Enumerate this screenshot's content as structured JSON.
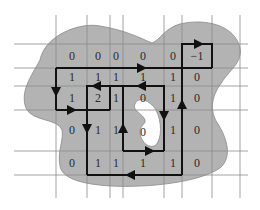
{
  "diagram": {
    "type": "winding-number-grid",
    "colors": {
      "region_fill": "#b3b3b3",
      "region_stroke": "#7a7a7a",
      "grid_line": "#8a8a8a",
      "path_stroke": "#111111",
      "hole_fill": "#ffffff",
      "text": "#2a2a2a"
    },
    "grid": {
      "vertical_lines_x": [
        56,
        87,
        110,
        123,
        164,
        182,
        212,
        240
      ],
      "horizontal_lines_y": [
        44,
        68,
        86,
        110,
        151,
        175
      ]
    },
    "rows": [
      {
        "y": 56,
        "cells": [
          {
            "x": 72,
            "value": "0"
          },
          {
            "x": 98,
            "value": "0"
          },
          {
            "x": 116,
            "value": "0"
          },
          {
            "x": 143,
            "value": "0"
          },
          {
            "x": 173,
            "value": "0"
          },
          {
            "x": 197,
            "value": "−1"
          }
        ]
      },
      {
        "y": 77,
        "cells": [
          {
            "x": 72,
            "value": "1"
          },
          {
            "x": 98,
            "value": "1"
          },
          {
            "x": 116,
            "value": "1"
          },
          {
            "x": 143,
            "value": "1"
          },
          {
            "x": 173,
            "value": "1"
          },
          {
            "x": 197,
            "value": "0"
          }
        ]
      },
      {
        "y": 98,
        "cells": [
          {
            "x": 72,
            "value": "1"
          },
          {
            "x": 98,
            "value": "2"
          },
          {
            "x": 116,
            "value": "1"
          },
          {
            "x": 143,
            "value": "0"
          },
          {
            "x": 173,
            "value": "1"
          },
          {
            "x": 197,
            "value": "0"
          }
        ]
      },
      {
        "y": 130,
        "cells": [
          {
            "x": 72,
            "value": "0"
          },
          {
            "x": 98,
            "value": "1"
          },
          {
            "x": 116,
            "value": "1"
          },
          {
            "x": 143,
            "value": "0"
          },
          {
            "x": 173,
            "value": "1"
          },
          {
            "x": 197,
            "value": "0"
          }
        ]
      },
      {
        "y": 163,
        "cells": [
          {
            "x": 72,
            "value": "0"
          },
          {
            "x": 98,
            "value": "1"
          },
          {
            "x": 116,
            "value": "1"
          },
          {
            "x": 143,
            "value": "1"
          },
          {
            "x": 173,
            "value": "1"
          },
          {
            "x": 197,
            "value": "0"
          }
        ]
      }
    ]
  }
}
